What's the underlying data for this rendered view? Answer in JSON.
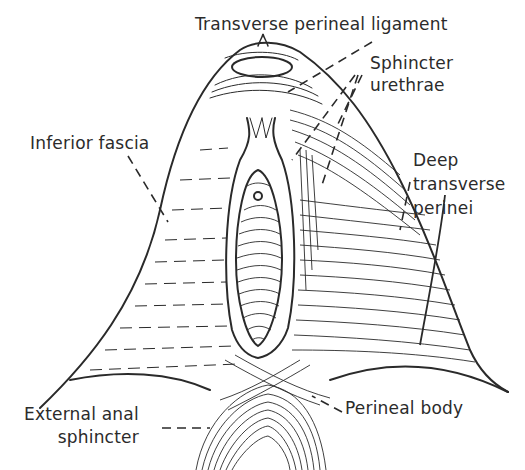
{
  "figure": {
    "colors": {
      "ink": "#2a2a2a",
      "background": "#ffffff",
      "text": "#2b2b2b"
    }
  },
  "labels": {
    "transverse_perineal_ligament": "Transverse perineal ligament",
    "sphincter_urethrae": "Sphincter\nurethrae",
    "inferior_fascia": "Inferior fascia",
    "deep_transverse_perinei": "Deep\ntransverse\nperinei",
    "external_anal_sphincter": "External anal\nsphincter",
    "perineal_body": "Perineal body"
  }
}
